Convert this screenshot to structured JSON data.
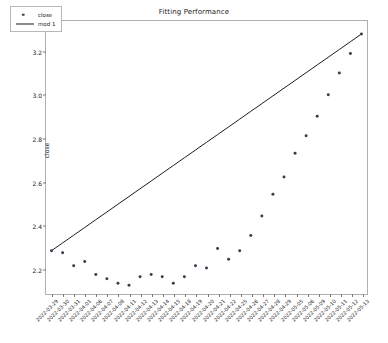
{
  "chart_data": {
    "type": "scatter",
    "title": "Fitting Performance",
    "xlabel": "",
    "ylabel": "close",
    "grid": false,
    "legend_position": "upper left",
    "ylim": [
      2.08,
      3.34
    ],
    "yticks": [
      2.2,
      2.4,
      2.6,
      2.8,
      3.0,
      3.2
    ],
    "ytick_labels": [
      "2.2",
      "2.4",
      "2.6",
      "2.8",
      "3.0",
      "3.2"
    ],
    "categories": [
      "2022-03-29",
      "2022-03-30",
      "2022-03-31",
      "2022-04-01",
      "2022-04-06",
      "2022-04-07",
      "2022-04-08",
      "2022-04-11",
      "2022-04-12",
      "2022-04-13",
      "2022-04-14",
      "2022-04-15",
      "2022-04-18",
      "2022-04-19",
      "2022-04-20",
      "2022-04-21",
      "2022-04-22",
      "2022-04-25",
      "2022-04-26",
      "2022-04-27",
      "2022-04-28",
      "2022-04-29",
      "2022-05-05",
      "2022-05-06",
      "2022-05-09",
      "2022-05-10",
      "2022-05-11",
      "2022-05-12",
      "2022-05-13"
    ],
    "series": [
      {
        "name": "close",
        "marker": "dot",
        "color": "#3b3b4f",
        "values": [
          2.28,
          2.27,
          2.21,
          2.23,
          2.17,
          2.15,
          2.13,
          2.12,
          2.16,
          2.17,
          2.16,
          2.13,
          2.16,
          2.21,
          2.2,
          2.29,
          2.24,
          2.28,
          2.35,
          2.44,
          2.54,
          2.62,
          2.73,
          2.81,
          2.9,
          3.0,
          3.1,
          3.19,
          3.28
        ]
      },
      {
        "name": "mod 1",
        "marker": "line",
        "color": "#1a1a1a",
        "values": [
          2.28,
          2.3157,
          2.3514,
          2.3871,
          2.4229,
          2.4586,
          2.4943,
          2.53,
          2.5657,
          2.6014,
          2.6371,
          2.6729,
          2.7086,
          2.7443,
          2.78,
          2.8157,
          2.8514,
          2.8871,
          2.9229,
          2.9586,
          2.9943,
          3.03,
          3.0657,
          3.1014,
          3.1371,
          3.1729,
          3.2086,
          3.2443,
          3.28
        ]
      }
    ],
    "legend": [
      {
        "label": "close",
        "type": "marker"
      },
      {
        "label": "mod 1",
        "type": "line"
      }
    ]
  }
}
